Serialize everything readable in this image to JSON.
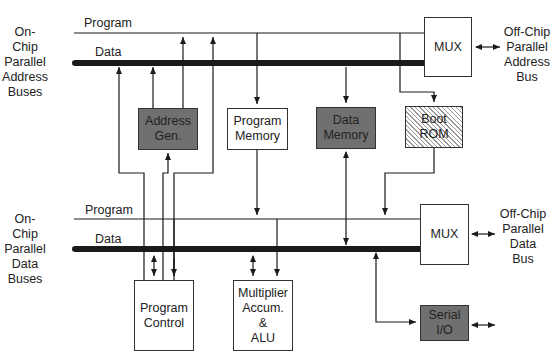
{
  "diagram": {
    "type": "block-diagram",
    "side_labels": {
      "address_buses": "On-Chip\nParallel\nAddress\nBuses",
      "data_buses": "On-Chip\nParallel\nData\nBuses",
      "offchip_address": "Off-Chip\nParallel\nAddress\nBus",
      "offchip_data": "Off-Chip\nParallel\nData\nBus"
    },
    "buses": {
      "address_program": "Program",
      "address_data": "Data",
      "data_program": "Program",
      "data_data": "Data"
    },
    "blocks": {
      "address_mux": "MUX",
      "address_gen": "Address\nGen.",
      "program_memory": "Program\nMemory",
      "data_memory": "Data\nMemory",
      "boot_rom": "Boot\nROM",
      "data_mux": "MUX",
      "program_control": "Program\nControl",
      "mac_alu": "Multiplier\nAccum.\n&\nALU",
      "serial_io": "Serial\nI/O"
    },
    "colors": {
      "dark_block": "#707070",
      "light_block": "#ffffff",
      "line": "#1a1a1a"
    }
  }
}
